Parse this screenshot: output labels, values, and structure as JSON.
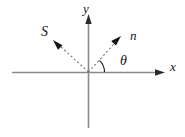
{
  "figure": {
    "kind": "vector-diagram",
    "background_color": "#ffffff",
    "width": 185,
    "height": 137,
    "axes": {
      "x_axis": {
        "label": "x",
        "icon": "arrow-right-icon",
        "style": "solid",
        "color": "#8a8a8a",
        "start": [
          12,
          72
        ],
        "end": [
          165,
          72
        ],
        "label_position": [
          170,
          60
        ]
      },
      "y_axis": {
        "label": "y",
        "icon": "arrow-up-icon",
        "style": "solid",
        "color": "#8a8a8a",
        "start": [
          88,
          128
        ],
        "end": [
          88,
          14
        ],
        "label_position": [
          83,
          2
        ]
      },
      "origin": [
        88,
        72
      ]
    },
    "vectors": [
      {
        "label": "n",
        "name": "normal-vector",
        "style": "dashed",
        "color": "#6f6f6f",
        "arrowhead_color": "#141414",
        "from": [
          88,
          72
        ],
        "to": [
          121,
          36
        ],
        "angle_from_x_axis_deg": 47,
        "label_position": [
          130,
          29
        ]
      },
      {
        "label": "S",
        "name": "poynting-vector",
        "style": "dashed",
        "color": "#6f6f6f",
        "arrowhead_color": "#141414",
        "from": [
          88,
          72
        ],
        "to": [
          53,
          40
        ],
        "angle_from_x_axis_deg": 137,
        "label_position": [
          41,
          25
        ]
      }
    ],
    "angle": {
      "label": "θ",
      "name": "theta-angle",
      "between": [
        "x-axis",
        "n"
      ],
      "vertex": [
        88,
        72
      ],
      "radius": 16,
      "start_deg": 0,
      "end_deg": 47,
      "color": "#1a1a1a",
      "label_position": [
        120,
        54
      ]
    }
  }
}
